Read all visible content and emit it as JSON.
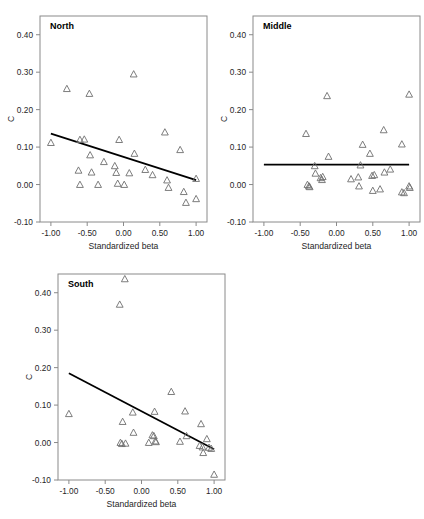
{
  "figure": {
    "axis_x_title": "Standardized beta",
    "axis_y_title": "C"
  },
  "chart_data": [
    {
      "type": "scatter",
      "title": "North",
      "xlabel": "Standardized beta",
      "ylabel": "C",
      "xlim": [
        -1.15,
        1.15
      ],
      "ylim": [
        -0.1,
        0.45
      ],
      "xticks": [
        -1.0,
        -0.5,
        0.0,
        0.5,
        1.0
      ],
      "xticklabels": [
        "-1.00",
        "-0.50",
        "0.00",
        "0.50",
        "1.00"
      ],
      "yticks": [
        -0.1,
        0.0,
        0.1,
        0.2,
        0.3,
        0.4
      ],
      "yticklabels": [
        "-0.10",
        "0.00",
        "0.10",
        "0.20",
        "0.30",
        "0.40"
      ],
      "grid": false,
      "marker": "open-triangle",
      "points": [
        [
          -1.0,
          0.112
        ],
        [
          -0.78,
          0.256
        ],
        [
          -0.62,
          0.038
        ],
        [
          -0.6,
          0.12
        ],
        [
          -0.6,
          0.0
        ],
        [
          -0.54,
          0.121
        ],
        [
          -0.47,
          0.243
        ],
        [
          -0.46,
          0.079
        ],
        [
          -0.44,
          0.033
        ],
        [
          -0.35,
          0.0
        ],
        [
          -0.27,
          0.061
        ],
        [
          -0.12,
          0.05
        ],
        [
          -0.1,
          0.032
        ],
        [
          -0.08,
          0.003
        ],
        [
          -0.06,
          0.12
        ],
        [
          0.01,
          0.0
        ],
        [
          0.08,
          0.031
        ],
        [
          0.14,
          0.295
        ],
        [
          0.15,
          0.083
        ],
        [
          0.3,
          0.04
        ],
        [
          0.4,
          0.026
        ],
        [
          0.57,
          0.14
        ],
        [
          0.6,
          0.012
        ],
        [
          0.62,
          -0.008
        ],
        [
          0.78,
          0.093
        ],
        [
          0.83,
          -0.019
        ],
        [
          0.86,
          -0.048
        ],
        [
          1.0,
          0.016
        ],
        [
          1.0,
          -0.038
        ]
      ],
      "fit_line": {
        "x1": -1.0,
        "y1": 0.136,
        "x2": 1.0,
        "y2": 0.012
      }
    },
    {
      "type": "scatter",
      "title": "Middle",
      "xlabel": "Standardized beta",
      "ylabel": "C",
      "xlim": [
        -1.15,
        1.15
      ],
      "ylim": [
        -0.1,
        0.45
      ],
      "xticks": [
        -1.0,
        -0.5,
        0.0,
        0.5,
        1.0
      ],
      "xticklabels": [
        "-1.00",
        "-0.50",
        "0.00",
        "0.50",
        "1.00"
      ],
      "yticks": [
        -0.1,
        0.0,
        0.1,
        0.2,
        0.3,
        0.4
      ],
      "yticklabels": [
        "-0.10",
        "0.00",
        "0.10",
        "0.20",
        "0.30",
        "0.40"
      ],
      "grid": false,
      "marker": "open-triangle",
      "points": [
        [
          -0.42,
          0.136
        ],
        [
          -0.4,
          0.0
        ],
        [
          -0.38,
          -0.004
        ],
        [
          -0.37,
          -0.006
        ],
        [
          -0.3,
          0.05
        ],
        [
          -0.29,
          0.03
        ],
        [
          -0.22,
          0.018
        ],
        [
          -0.2,
          0.013
        ],
        [
          -0.19,
          0.021
        ],
        [
          -0.13,
          0.237
        ],
        [
          -0.11,
          0.075
        ],
        [
          0.2,
          0.015
        ],
        [
          0.3,
          0.02
        ],
        [
          0.31,
          -0.004
        ],
        [
          0.33,
          0.052
        ],
        [
          0.36,
          0.107
        ],
        [
          0.46,
          0.083
        ],
        [
          0.49,
          0.024
        ],
        [
          0.5,
          -0.016
        ],
        [
          0.52,
          0.026
        ],
        [
          0.6,
          -0.012
        ],
        [
          0.65,
          0.146
        ],
        [
          0.66,
          0.033
        ],
        [
          0.74,
          0.041
        ],
        [
          0.9,
          0.108
        ],
        [
          0.9,
          -0.02
        ],
        [
          0.93,
          -0.022
        ],
        [
          1.0,
          0.241
        ],
        [
          1.0,
          -0.004
        ],
        [
          1.01,
          -0.008
        ]
      ],
      "fit_line": {
        "x1": -1.0,
        "y1": 0.053,
        "x2": 1.0,
        "y2": 0.053
      }
    },
    {
      "type": "scatter",
      "title": "South",
      "xlabel": "Standardized beta",
      "ylabel": "C",
      "xlim": [
        -1.15,
        1.15
      ],
      "ylim": [
        -0.1,
        0.45
      ],
      "xticks": [
        -1.0,
        -0.5,
        0.0,
        0.5,
        1.0
      ],
      "xticklabels": [
        "-1.00",
        "-0.50",
        "0.00",
        "0.50",
        "1.00"
      ],
      "yticks": [
        -0.1,
        0.0,
        0.1,
        0.2,
        0.3,
        0.4
      ],
      "yticklabels": [
        "-0.10",
        "0.00",
        "0.10",
        "0.20",
        "0.30",
        "0.40"
      ],
      "grid": false,
      "marker": "open-triangle",
      "points": [
        [
          -1.0,
          0.077
        ],
        [
          -0.3,
          0.369
        ],
        [
          -0.29,
          0.0
        ],
        [
          -0.27,
          -0.003
        ],
        [
          -0.26,
          0.056
        ],
        [
          -0.23,
          0.437
        ],
        [
          -0.22,
          -0.002
        ],
        [
          -0.12,
          0.081
        ],
        [
          -0.11,
          0.027
        ],
        [
          0.1,
          0.0
        ],
        [
          0.15,
          0.02
        ],
        [
          0.17,
          0.018
        ],
        [
          0.18,
          0.083
        ],
        [
          0.19,
          0.004
        ],
        [
          0.2,
          0.002
        ],
        [
          0.41,
          0.136
        ],
        [
          0.53,
          0.003
        ],
        [
          0.6,
          0.084
        ],
        [
          0.62,
          0.018
        ],
        [
          0.8,
          -0.008
        ],
        [
          0.82,
          0.05
        ],
        [
          0.84,
          -0.012
        ],
        [
          0.85,
          -0.027
        ],
        [
          0.9,
          0.01
        ],
        [
          0.93,
          -0.013
        ],
        [
          0.96,
          -0.016
        ],
        [
          1.0,
          -0.085
        ]
      ],
      "fit_line": {
        "x1": -1.0,
        "y1": 0.185,
        "x2": 1.0,
        "y2": -0.018
      }
    }
  ]
}
